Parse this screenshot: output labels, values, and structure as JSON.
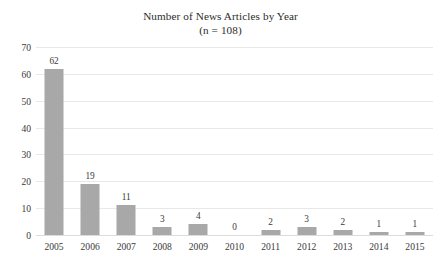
{
  "chart_data": {
    "type": "bar",
    "title": "Number of News Articles by Year",
    "subtitle": "(n = 108)",
    "xlabel": "",
    "ylabel": "",
    "categories": [
      "2005",
      "2006",
      "2007",
      "2008",
      "2009",
      "2010",
      "2011",
      "2012",
      "2013",
      "2014",
      "2015"
    ],
    "values": [
      62,
      19,
      11,
      3,
      4,
      0,
      2,
      3,
      2,
      1,
      1
    ],
    "data_labels": [
      "62",
      "19",
      "11",
      "3",
      "4",
      "0",
      "2",
      "3",
      "2",
      "1",
      "1"
    ],
    "ylim": [
      0,
      70
    ],
    "yticks": [
      0,
      10,
      20,
      30,
      40,
      50,
      60,
      70
    ],
    "ytick_labels": [
      "0",
      "10",
      "20",
      "30",
      "40",
      "50",
      "60",
      "70"
    ],
    "grid": true,
    "grid_axis": "y",
    "legend": false,
    "bar_color": "#a8a8a8",
    "grid_color": "#e8e8e8",
    "text_color": "#3a3a3a",
    "background": "#ffffff"
  }
}
